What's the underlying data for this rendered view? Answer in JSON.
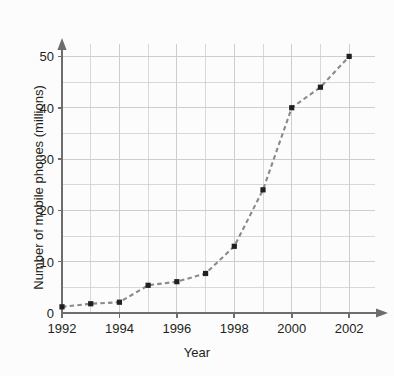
{
  "chart_data": {
    "type": "line",
    "title": "",
    "xlabel": "Year",
    "ylabel": "Number of mobile phones (millions)",
    "x": [
      1992,
      1993,
      1994,
      1995,
      1996,
      1997,
      1998,
      1999,
      2000,
      2001,
      2002
    ],
    "values": [
      1.2,
      1.8,
      2.1,
      5.4,
      6.1,
      7.7,
      13,
      24,
      40,
      44,
      50
    ],
    "series": [
      {
        "name": "Number of mobile phones (millions)",
        "values": [
          1.2,
          1.8,
          2.1,
          5.4,
          6.1,
          7.7,
          13,
          24,
          40,
          44,
          50
        ]
      }
    ],
    "xlim": [
      1992,
      2002.9
    ],
    "ylim": [
      0,
      53
    ],
    "x_tick_labels": [
      "1992",
      "1994",
      "1996",
      "1998",
      "2000",
      "2002"
    ],
    "x_tick_values": [
      1992,
      1994,
      1996,
      1998,
      2000,
      2002
    ],
    "x_minor_step": 1,
    "y_tick_labels": [
      "0",
      "10",
      "20",
      "30",
      "40",
      "50"
    ],
    "y_tick_values": [
      0,
      10,
      20,
      30,
      40,
      50
    ],
    "y_minor_step": 5,
    "grid": true,
    "grid_color": "#c9c9c9",
    "legend": "none",
    "line_style": "dashed",
    "line_color": "#8a8a8a",
    "marker": "square",
    "marker_color": "#231f20",
    "axis_color": "#6d6d6d",
    "background_color": "#fcfcfc",
    "text_color": "#231f20"
  },
  "axis_titles": {
    "x": "Year",
    "y": "Number of mobile phones (millions)"
  }
}
